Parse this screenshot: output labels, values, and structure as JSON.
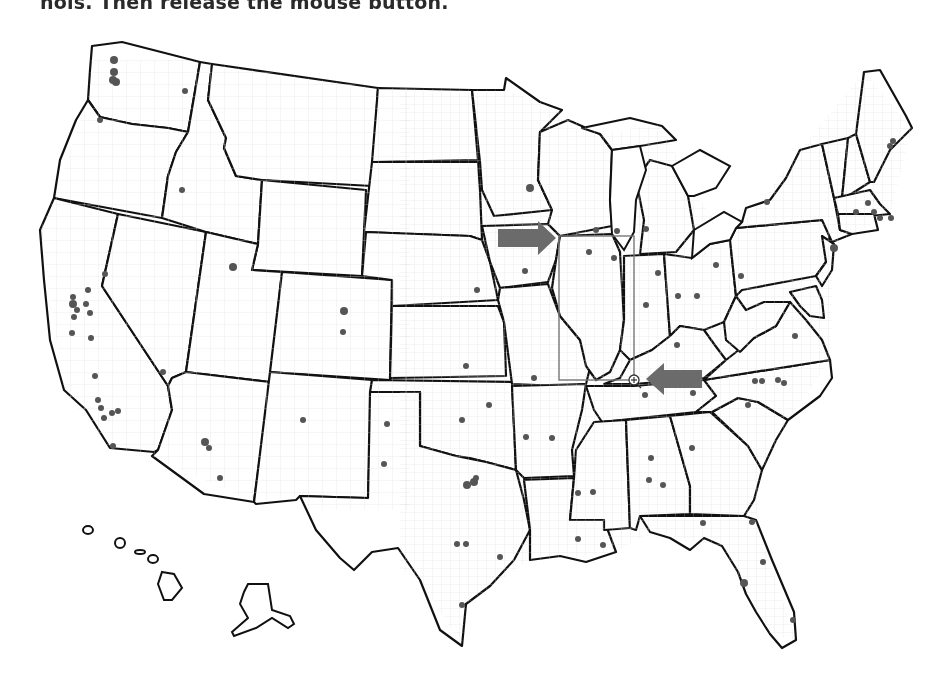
{
  "instruction": {
    "text": "nois. Then release the mouse button."
  },
  "map": {
    "title": "United States counties map",
    "colors": {
      "state_border": "#111111",
      "county_border": "#d6d6d6",
      "dot": "#555555",
      "arrow": "#6b6b6b",
      "selection": "#777777"
    },
    "selection_rectangle": {
      "x1": 559,
      "y1": 236,
      "x2": 634,
      "y2": 380
    },
    "cursor": {
      "type": "crosshair-icon",
      "x": 634,
      "y": 380
    },
    "arrows": [
      {
        "name": "right-arrow",
        "direction": "right",
        "x1": 498,
        "x2": 556,
        "y": 238
      },
      {
        "name": "left-arrow",
        "direction": "left",
        "x1": 646,
        "x2": 702,
        "y": 379
      }
    ]
  }
}
